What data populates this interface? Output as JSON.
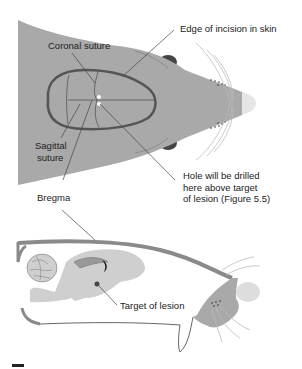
{
  "diagram": {
    "labels": {
      "edge_incision": "Edge of incision in skin",
      "coronal_suture": "Coronal suture",
      "sagittal_suture_1": "Sagittal",
      "sagittal_suture_2": "suture",
      "hole_1": "Hole will be drilled",
      "hole_2": "here above target",
      "hole_3": "of lesion (Figure 5.5)",
      "bregma": "Bregma",
      "target": "Target of lesion"
    },
    "colors": {
      "head_fill": "#a9a9a9",
      "incision_stroke": "#555555",
      "ear": "#444444",
      "nose": "#e6e6e6",
      "brain_fill": "#cfcfcf",
      "skull": "#8a8a8a",
      "whisker": "#bbbbbb"
    },
    "panels": [
      "top-view",
      "sagittal-section"
    ]
  }
}
